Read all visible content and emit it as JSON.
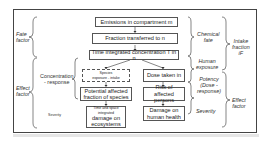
{
  "boxes": {
    "emissions": "Emissions in compartment m",
    "fraction": "Fraction transferred to n",
    "time_integrated": "Time integrated concentration  T in n",
    "species_exposure_top": "Species",
    "species_exposure_bottom": "exposure - intake",
    "dose_taken": "Dose taken in",
    "potential_affected_1": "Potential affected",
    "potential_affected_2": "fraction of species",
    "risk_1": "Risk of affected",
    "risk_2": "persons",
    "eco_damage_small_1": "Time and space",
    "eco_damage_small_2": "integrated",
    "eco_damage_1": "damage on",
    "eco_damage_2": "ecosystems",
    "health_1": "Damage on",
    "health_2": "human health"
  },
  "left_labels": {
    "fate_1": "Fate",
    "fate_2": "factor",
    "effect_1": "Effect",
    "effect_2": "factor",
    "conc_1": "Concentration",
    "conc_2": "- response",
    "severity": "Severity"
  },
  "right_labels": {
    "chemical_1": "Chemical",
    "chemical_2": "fate",
    "human_1": "Human",
    "human_2": "exposure",
    "intake_1": "Intake",
    "intake_2": "fraction",
    "intake_3": "iF",
    "potency_1": "Potency",
    "potency_2": "(Dose -",
    "potency_3": "response)",
    "severity": "Severity",
    "effect_1": "Effect",
    "effect_2": "factor"
  }
}
